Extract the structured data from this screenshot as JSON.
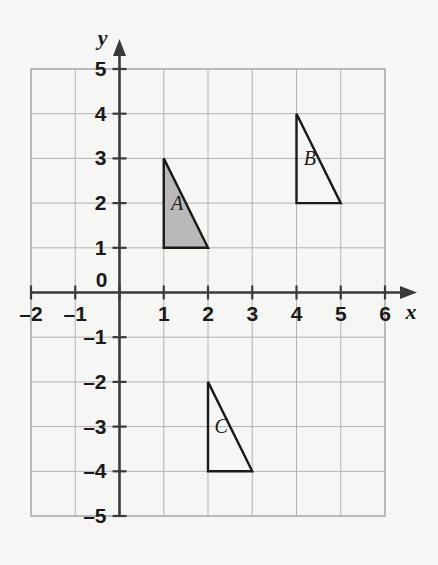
{
  "figure": {
    "background_color": "#f6f6f4"
  },
  "chart_data": {
    "type": "scatter",
    "title": "",
    "xlabel": "x",
    "ylabel": "y",
    "xlim": [
      -2,
      6
    ],
    "ylim": [
      -5,
      5
    ],
    "grid": true,
    "grid_spacing": 1,
    "legend": "none",
    "x_ticks": [
      -2,
      -1,
      0,
      1,
      2,
      3,
      4,
      5,
      6
    ],
    "y_ticks": [
      -5,
      -4,
      -3,
      -2,
      -1,
      0,
      1,
      2,
      3,
      4,
      5
    ],
    "x_tick_labels": [
      "–2",
      "–1",
      "0",
      "1",
      "2",
      "3",
      "4",
      "5",
      "6"
    ],
    "y_tick_labels": [
      "–5",
      "–4",
      "–3",
      "–2",
      "–1",
      "1",
      "2",
      "3",
      "4",
      "5"
    ],
    "origin_label": "0",
    "shapes": [
      {
        "name": "A",
        "label": "A",
        "type": "triangle",
        "vertices": [
          [
            1,
            3
          ],
          [
            1,
            1
          ],
          [
            2,
            1
          ]
        ],
        "fill": "#b9b9b9",
        "stroke": "#1a1a1a",
        "label_position": [
          1.3,
          1.85
        ]
      },
      {
        "name": "B",
        "label": "B",
        "type": "triangle",
        "vertices": [
          [
            4,
            4
          ],
          [
            4,
            2
          ],
          [
            5,
            2
          ]
        ],
        "fill": "none",
        "stroke": "#1a1a1a",
        "label_position": [
          4.3,
          2.85
        ]
      },
      {
        "name": "C",
        "label": "C",
        "type": "triangle",
        "vertices": [
          [
            2,
            -2
          ],
          [
            2,
            -4
          ],
          [
            3,
            -4
          ]
        ],
        "fill": "none",
        "stroke": "#1a1a1a",
        "label_position": [
          2.3,
          -3.15
        ]
      }
    ]
  },
  "colors": {
    "grid_line": "#b2b2b2",
    "axis_line": "#3a3a3a",
    "text": "#1a1a1a",
    "shape_fill_gray": "#b9b9b9",
    "shape_stroke": "#1a1a1a"
  }
}
